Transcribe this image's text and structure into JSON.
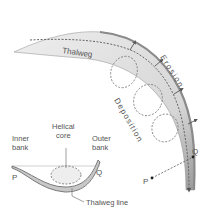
{
  "labels": {
    "thalweg": "Thalweg",
    "erosion": "Erosion",
    "deposition": "Deposition",
    "helical_core_line1": "Helical",
    "helical_core_line2": "core",
    "inner_bank_line1": "Inner",
    "inner_bank_line2": "bank",
    "outer_bank_line1": "Outer",
    "outer_bank_line2": "bank",
    "point_p": "P",
    "point_q": "Q",
    "thalweg_line": "Thalweg line",
    "plan_p": "P",
    "plan_q": "Q"
  },
  "colors": {
    "channel_fill": "#e2e2e2",
    "channel_edge": "#8a8a8a",
    "dashed": "#6a6a6a",
    "text": "#555555"
  }
}
